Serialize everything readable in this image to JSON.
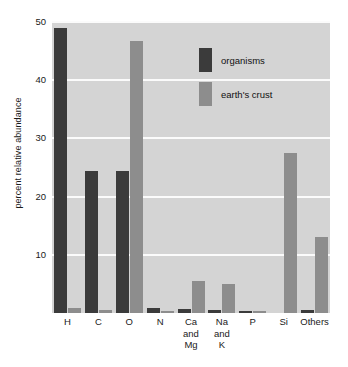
{
  "chart_data": {
    "type": "bar",
    "title": "",
    "xlabel": "",
    "ylabel": "percent relative abundance",
    "ylim": [
      0,
      50
    ],
    "yticks": [
      10,
      20,
      30,
      40,
      50
    ],
    "ytick_labels": [
      "10",
      "20",
      "30",
      "40",
      "50"
    ],
    "grid": true,
    "legend_position": "inside-upper-right",
    "categories": [
      "H",
      "C",
      "O",
      "N",
      "Ca and Mg",
      "Na and K",
      "P",
      "Si",
      "Others"
    ],
    "category_lines": [
      [
        "H"
      ],
      [
        "C"
      ],
      [
        "O"
      ],
      [
        "N"
      ],
      [
        "Ca",
        "and",
        "Mg"
      ],
      [
        "Na",
        "and",
        "K"
      ],
      [
        "P"
      ],
      [
        "Si"
      ],
      [
        "Others"
      ]
    ],
    "series": [
      {
        "name": "organisms",
        "color": "#3b3b3b",
        "values": [
          49.0,
          24.4,
          24.4,
          0.8,
          0.7,
          0.6,
          0.4,
          0.0,
          0.6
        ]
      },
      {
        "name": "earth's crust",
        "color": "#8d8d8d",
        "values": [
          0.9,
          0.6,
          46.7,
          0.3,
          5.5,
          4.9,
          0.2,
          27.5,
          13.0
        ]
      }
    ]
  },
  "legend": {
    "items": [
      {
        "label": "organisms",
        "color": "#3b3b3b"
      },
      {
        "label": "earth's crust",
        "color": "#8d8d8d"
      }
    ]
  },
  "axes": {
    "y_title": "percent relative abundance",
    "y_tick_labels": [
      "50",
      "40",
      "30",
      "20",
      "10"
    ]
  },
  "colors": {
    "plot_background": "#d4d4d4",
    "page_background": "#ffffff",
    "gridline": "#fbfbfb",
    "organisms": "#3b3b3b",
    "crust": "#8d8d8d",
    "text": "#1a1a1a"
  }
}
